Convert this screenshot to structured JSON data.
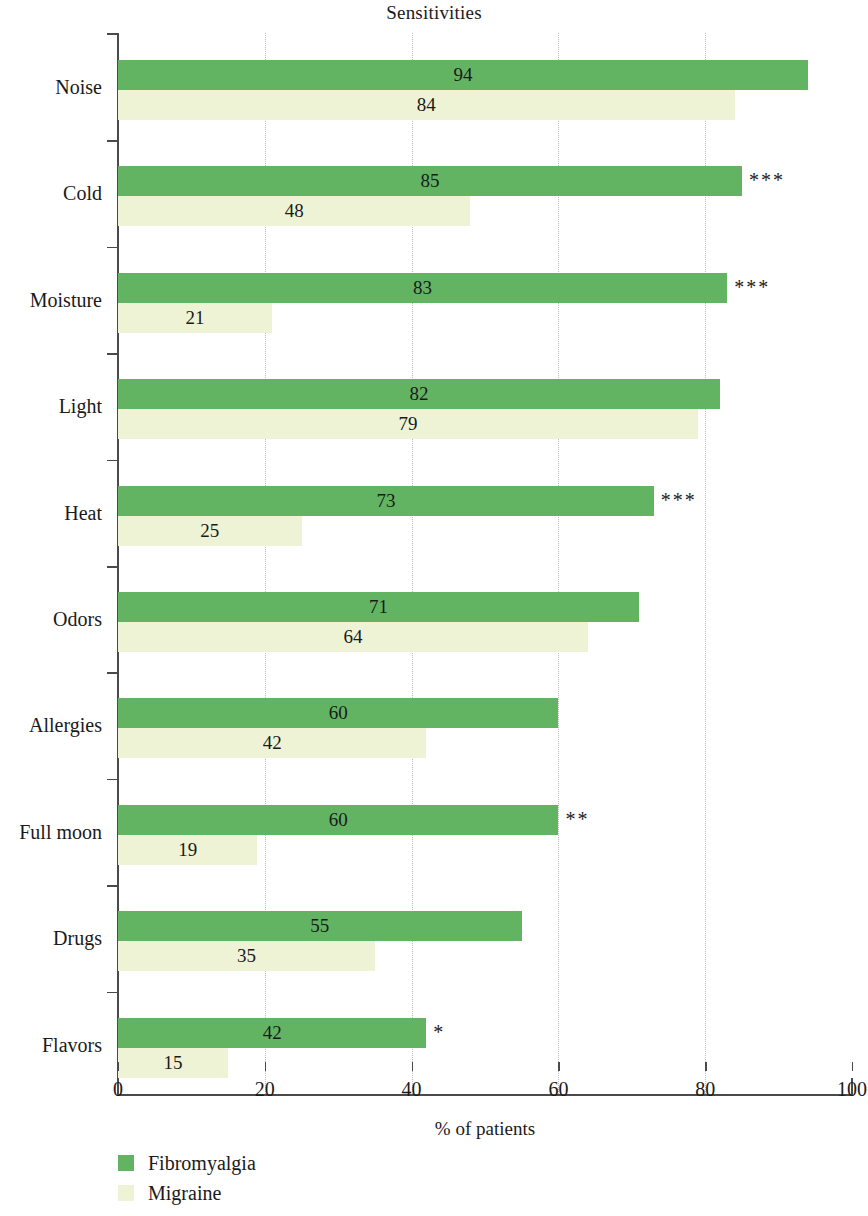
{
  "chart_data": {
    "type": "bar",
    "orientation": "horizontal",
    "title": "Sensitivities",
    "xlabel": "% of patients",
    "ylabel": "",
    "xlim": [
      0,
      100
    ],
    "xticks": [
      0,
      20,
      40,
      60,
      80,
      100
    ],
    "xtick_labels": [
      "0",
      "20",
      "40",
      "60",
      "80",
      "100"
    ],
    "grid": "vertical-dotted",
    "legend_position": "bottom-left",
    "categories": [
      "Noise",
      "Cold",
      "Moisture",
      "Light",
      "Heat",
      "Odors",
      "Allergies",
      "Full moon",
      "Drugs",
      "Flavors"
    ],
    "series": [
      {
        "name": "Fibromyalgia",
        "color": "#62b463",
        "values": [
          94,
          85,
          83,
          82,
          73,
          71,
          60,
          60,
          55,
          42
        ]
      },
      {
        "name": "Migraine",
        "color": "#eef3d6",
        "values": [
          84,
          48,
          21,
          79,
          25,
          64,
          42,
          19,
          35,
          15
        ]
      }
    ],
    "significance": [
      "",
      "***",
      "***",
      "",
      "***",
      "",
      "",
      "**",
      "",
      "*"
    ],
    "rows": [
      {
        "category": "Noise",
        "fibromyalgia": 94,
        "migraine": 84,
        "significance": ""
      },
      {
        "category": "Cold",
        "fibromyalgia": 85,
        "migraine": 48,
        "significance": "***"
      },
      {
        "category": "Moisture",
        "fibromyalgia": 83,
        "migraine": 21,
        "significance": "***"
      },
      {
        "category": "Light",
        "fibromyalgia": 82,
        "migraine": 79,
        "significance": ""
      },
      {
        "category": "Heat",
        "fibromyalgia": 73,
        "migraine": 25,
        "significance": "***"
      },
      {
        "category": "Odors",
        "fibromyalgia": 71,
        "migraine": 64,
        "significance": ""
      },
      {
        "category": "Allergies",
        "fibromyalgia": 60,
        "migraine": 42,
        "significance": ""
      },
      {
        "category": "Full moon",
        "fibromyalgia": 60,
        "migraine": 19,
        "significance": "**"
      },
      {
        "category": "Drugs",
        "fibromyalgia": 55,
        "migraine": 35,
        "significance": ""
      },
      {
        "category": "Flavors",
        "fibromyalgia": 42,
        "migraine": 15,
        "significance": "*"
      }
    ]
  },
  "legend": {
    "items": [
      {
        "label": "Fibromyalgia",
        "color": "#62b463"
      },
      {
        "label": "Migraine",
        "color": "#eef3d6"
      }
    ]
  }
}
